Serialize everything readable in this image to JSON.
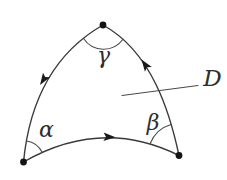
{
  "figure": {
    "type": "math-diagram",
    "background_color": "#ffffff",
    "line_color": "#3a3a3a",
    "ink_color": "#1a1a1a",
    "labels": {
      "alpha": "α",
      "beta": "β",
      "gamma": "γ",
      "region": "D"
    },
    "vertices": [
      {
        "name": "top",
        "x": 103,
        "y": 25,
        "angle_label": "γ"
      },
      {
        "name": "bottom-left",
        "x": 24,
        "y": 162,
        "angle_label": "α"
      },
      {
        "name": "bottom-right",
        "x": 179,
        "y": 155,
        "angle_label": "β"
      }
    ],
    "edges": [
      {
        "name": "bottom-arc",
        "from": "bottom-left",
        "to": "bottom-right",
        "bulge": "up",
        "arrow_direction": "right"
      },
      {
        "name": "right-arc",
        "from": "bottom-right",
        "to": "top",
        "bulge": "right",
        "arrow_direction": "up-left"
      },
      {
        "name": "left-arc",
        "from": "top",
        "to": "bottom-left",
        "bulge": "left",
        "arrow_direction": "down-left"
      }
    ],
    "orientation": "counterclockwise",
    "leader_line": {
      "from_label": "D",
      "points_into_region": true
    }
  }
}
